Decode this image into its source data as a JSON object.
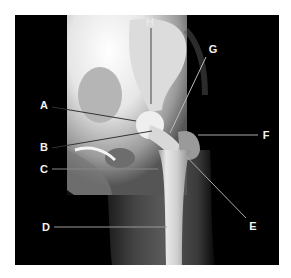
{
  "figure": {
    "type": "radiograph",
    "labels": [
      {
        "id": "A",
        "text": "A",
        "x": 44,
        "y": 105,
        "line": [
          52,
          107,
          136,
          121
        ]
      },
      {
        "id": "B",
        "text": "B",
        "x": 44,
        "y": 147,
        "line": [
          52,
          148,
          152,
          131
        ]
      },
      {
        "id": "C",
        "text": "C",
        "x": 44,
        "y": 169,
        "line": [
          52,
          169,
          158,
          169
        ]
      },
      {
        "id": "D",
        "text": "D",
        "x": 46,
        "y": 227,
        "line": [
          54,
          227,
          167,
          227
        ]
      },
      {
        "id": "E",
        "text": "E",
        "x": 253,
        "y": 226,
        "line": [
          246,
          218,
          178,
          148
        ]
      },
      {
        "id": "F",
        "text": "F",
        "x": 266,
        "y": 135,
        "line": [
          258,
          135,
          198,
          135
        ]
      },
      {
        "id": "G",
        "text": "G",
        "x": 213,
        "y": 49,
        "line": [
          206,
          57,
          170,
          133
        ]
      },
      {
        "id": "H",
        "text": "H",
        "x": 150,
        "y": 22,
        "line": [
          151,
          28,
          151,
          104
        ]
      }
    ]
  }
}
